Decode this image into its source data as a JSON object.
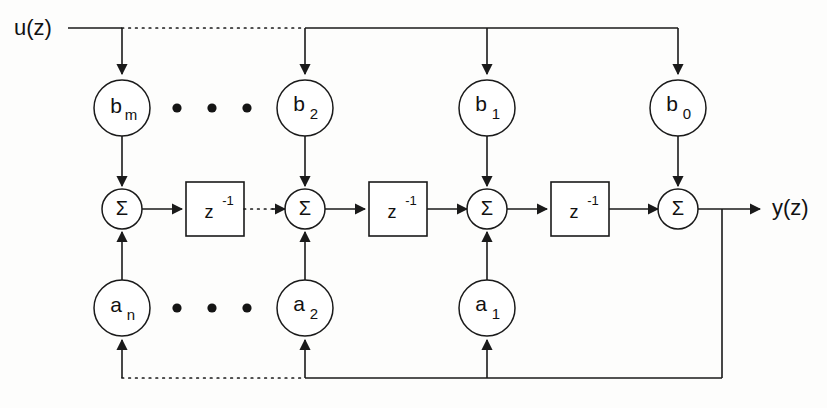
{
  "figure": {
    "line_color": "#1a1a1a",
    "background_color": "#fdfdfc"
  },
  "io": {
    "input_label": "u(z)",
    "output_label": "y(z)"
  },
  "sum_symbol": "Σ",
  "delay": {
    "base": "z",
    "exponent": "-1"
  },
  "feedforward_coefficients": [
    {
      "base": "b",
      "subscript": "m",
      "label": "bm"
    },
    {
      "base": "b",
      "subscript": "2",
      "label": "b2"
    },
    {
      "base": "b",
      "subscript": "1",
      "label": "b1"
    },
    {
      "base": "b",
      "subscript": "0",
      "label": "b0"
    }
  ],
  "feedback_coefficients": [
    {
      "base": "a",
      "subscript": "n",
      "label": "an"
    },
    {
      "base": "a",
      "subscript": "2",
      "label": "a2"
    },
    {
      "base": "a",
      "subscript": "1",
      "label": "a1"
    }
  ],
  "summers": [
    {
      "label": "Σ"
    },
    {
      "label": "Σ"
    },
    {
      "label": "Σ"
    },
    {
      "label": "Σ"
    }
  ],
  "delay_blocks": [
    {
      "base": "z",
      "exponent": "-1"
    },
    {
      "base": "z",
      "exponent": "-1"
    },
    {
      "base": "z",
      "exponent": "-1"
    }
  ],
  "ellipses": {
    "top_row_dots": 3,
    "bottom_row_dots": 3
  }
}
